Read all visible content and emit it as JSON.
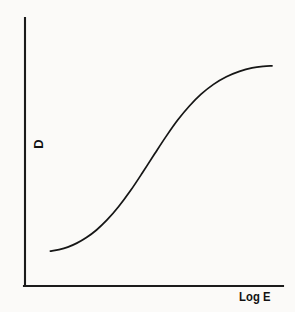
{
  "figure": {
    "kind": "characteristic-curve",
    "background_color": "#fbfaf8",
    "ink_color": "#161616",
    "width": 295,
    "height": 312
  },
  "axes": {
    "y_label": "D",
    "x_label": "Log E",
    "y_axis": {
      "x": 25,
      "y_top": 18,
      "y_bottom": 286
    },
    "x_axis": {
      "y": 286,
      "x_left": 25,
      "x_right": 283
    },
    "show_ticks": false,
    "show_grid": false
  },
  "chart_data": {
    "type": "line",
    "title": "",
    "subtitle": "",
    "xlabel": "Log E",
    "ylabel": "D",
    "xlim": [
      0,
      1
    ],
    "ylim": [
      0,
      1
    ],
    "grid": false,
    "legend": "none",
    "xticks": [],
    "yticks": [],
    "annotations": [],
    "series": [
      {
        "name": "Characteristic curve",
        "color": "#161616",
        "x": [
          0.053,
          0.09,
          0.127,
          0.166,
          0.207,
          0.25,
          0.295,
          0.344,
          0.397,
          0.449,
          0.5,
          0.549,
          0.597,
          0.647,
          0.697,
          0.75,
          0.805,
          0.861,
          0.915,
          0.963,
          1.0
        ],
        "y": [
          0.071,
          0.078,
          0.089,
          0.107,
          0.132,
          0.166,
          0.211,
          0.27,
          0.345,
          0.427,
          0.51,
          0.588,
          0.659,
          0.722,
          0.775,
          0.819,
          0.853,
          0.877,
          0.893,
          0.9,
          0.902
        ],
        "pixel_points": [
          [
            38,
            267
          ],
          [
            48,
            265
          ],
          [
            58,
            262
          ],
          [
            69,
            257
          ],
          [
            80,
            250
          ],
          [
            92,
            241
          ],
          [
            104,
            229
          ],
          [
            117,
            213
          ],
          [
            131,
            193
          ],
          [
            145,
            171
          ],
          [
            159,
            149
          ],
          [
            172,
            128
          ],
          [
            185,
            109
          ],
          [
            198,
            92
          ],
          [
            212,
            78
          ],
          [
            226,
            66
          ],
          [
            241,
            57
          ],
          [
            256,
            50
          ],
          [
            270,
            46
          ],
          [
            283,
            44
          ],
          [
            272,
            72
          ]
        ]
      }
    ]
  },
  "labels": {
    "y_axis_label": "D",
    "x_axis_label": "Log E"
  }
}
